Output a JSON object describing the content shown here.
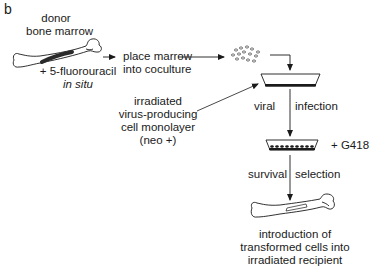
{
  "panel_label": "b",
  "steps": {
    "donor_title_line1": "donor",
    "donor_title_line2": "bone marrow",
    "treatment_line1": "+ 5-fluorouracil",
    "treatment_line2": "in situ",
    "place_line1": "place marrow",
    "place_line2": "into coculture",
    "monolayer_line1": "irradiated",
    "monolayer_line2": "virus-producing",
    "monolayer_line3": "cell monolayer",
    "monolayer_line4": "(neo +)",
    "infection_left": "viral",
    "infection_right": "infection",
    "g418": "+ G418",
    "survival_left": "survival",
    "survival_right": "selection",
    "intro_line1": "introduction of",
    "intro_line2": "transformed cells into",
    "intro_line3": "irradiated recipient"
  },
  "colors": {
    "ink": "#1a1a1a",
    "marrow": "#2a2a2a",
    "background": "#ffffff"
  }
}
